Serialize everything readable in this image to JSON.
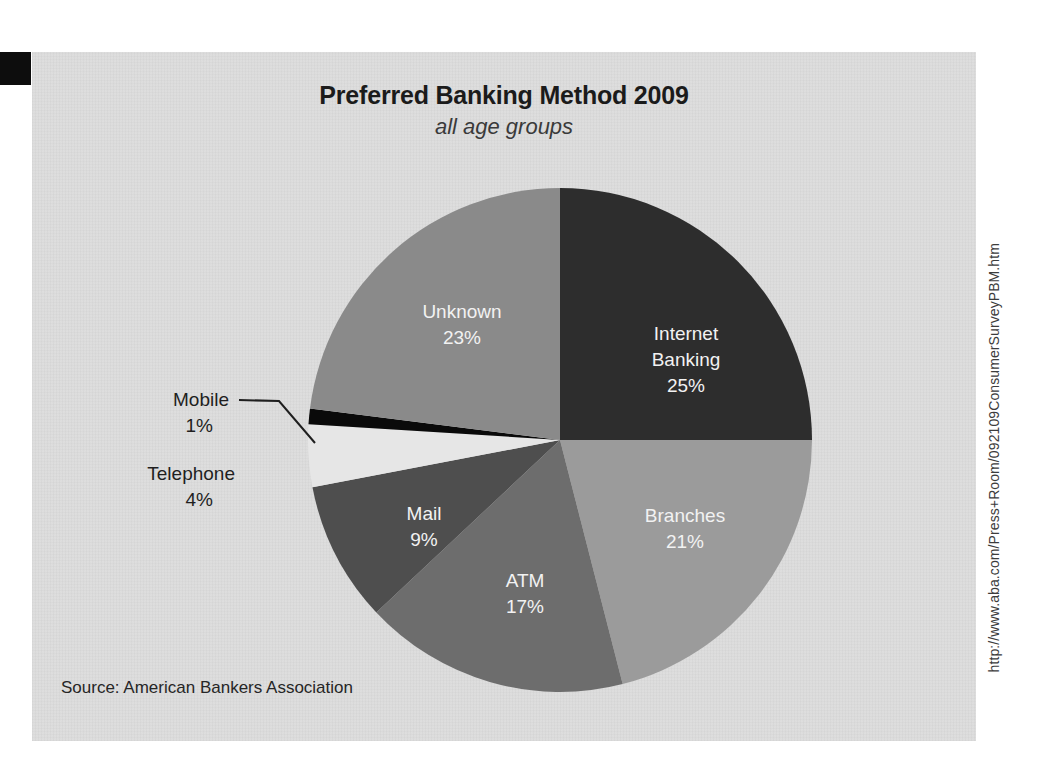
{
  "chart_data": {
    "type": "pie",
    "title": "Preferred Banking Method 2009",
    "subtitle": "all age groups",
    "source": "Source: American Bankers Association",
    "url": "http://www.aba.com/Press+Room/092109ConsumerSurveyPBM.htm",
    "legend_position": "none",
    "labels_inside": true,
    "units": "percent",
    "categories": [
      "Internet Banking",
      "Branches",
      "ATM",
      "Mail",
      "Telephone",
      "Mobile",
      "Unknown"
    ],
    "values": [
      25,
      21,
      17,
      9,
      4,
      1,
      23
    ],
    "slices": [
      {
        "name": "Internet Banking",
        "label": "Internet Banking",
        "label_line1": "Internet",
        "label_line2": "Banking",
        "value": 25,
        "value_label": "25%",
        "color": "#2d2d2d",
        "text_color": "#f2f2f2",
        "label_placement": "inside",
        "start_angle": 0,
        "end_angle": 90
      },
      {
        "name": "Branches",
        "label": "Branches",
        "label_line1": "Branches",
        "label_line2": "",
        "value": 21,
        "value_label": "21%",
        "color": "#9b9b9b",
        "text_color": "#f4f4f4",
        "label_placement": "inside",
        "start_angle": 90,
        "end_angle": 165.6
      },
      {
        "name": "ATM",
        "label": "ATM",
        "label_line1": "ATM",
        "label_line2": "",
        "value": 17,
        "value_label": "17%",
        "color": "#6d6d6d",
        "text_color": "#f2f2f2",
        "label_placement": "inside",
        "start_angle": 165.6,
        "end_angle": 226.8
      },
      {
        "name": "Mail",
        "label": "Mail",
        "label_line1": "Mail",
        "label_line2": "",
        "value": 9,
        "value_label": "9%",
        "color": "#4e4e4e",
        "text_color": "#f2f2f2",
        "label_placement": "inside",
        "start_angle": 226.8,
        "end_angle": 259.2
      },
      {
        "name": "Telephone",
        "label": "Telephone",
        "label_line1": "Telephone",
        "label_line2": "",
        "value": 4,
        "value_label": "4%",
        "color": "#e6e6e6",
        "text_color": "#1f1f1f",
        "label_placement": "outside",
        "start_angle": 259.2,
        "end_angle": 273.6
      },
      {
        "name": "Mobile",
        "label": "Mobile",
        "label_line1": "Mobile",
        "label_line2": "",
        "value": 1,
        "value_label": "1%",
        "color": "#0a0a0a",
        "text_color": "#1f1f1f",
        "label_placement": "outside-leader",
        "start_angle": 273.6,
        "end_angle": 277.2
      },
      {
        "name": "Unknown",
        "label": "Unknown",
        "label_line1": "Unknown",
        "label_line2": "",
        "value": 23,
        "value_label": "23%",
        "color": "#8a8a8a",
        "text_color": "#f2f2f2",
        "label_placement": "inside",
        "start_angle": 277.2,
        "end_angle": 360
      }
    ],
    "colors": {
      "panel_background": "#dcdcdc",
      "page_background": "#ffffff",
      "title_color": "#1b1b1b",
      "marker_block": "#0d0d0d"
    }
  },
  "labels": {
    "internet_banking_l1": "Internet",
    "internet_banking_l2": "Banking",
    "internet_banking_pct": "25%",
    "branches_name": "Branches",
    "branches_pct": "21%",
    "atm_name": "ATM",
    "atm_pct": "17%",
    "mail_name": "Mail",
    "mail_pct": "9%",
    "telephone_name": "Telephone",
    "telephone_pct": "4%",
    "mobile_name": "Mobile",
    "mobile_pct": "1%",
    "unknown_name": "Unknown",
    "unknown_pct": "23%"
  }
}
